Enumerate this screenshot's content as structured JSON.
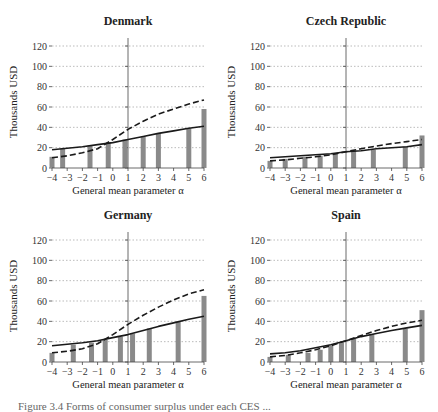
{
  "figure": {
    "ylabel": "Thousands USD",
    "xlabel": "General mean parameter α",
    "caption": "Figure 3.4   Forms of consumer surplus under each CES ..."
  },
  "chart_data": [
    {
      "type": "bar+line",
      "title": "Denmark",
      "xlabel": "General mean parameter α",
      "ylabel": "Thousands USD",
      "xlim": [
        -4,
        6
      ],
      "ylim": [
        0,
        120
      ],
      "xticks": [
        -4,
        -3,
        -2,
        -1,
        0,
        1,
        2,
        3,
        4,
        5,
        6
      ],
      "yticks": [
        0,
        20,
        40,
        60,
        80,
        100,
        120
      ],
      "grid": "horizontal dotted",
      "vline_at": 1,
      "bars": {
        "x": [
          -4,
          -3.3,
          -1.5,
          -0.3,
          0.8,
          2,
          3,
          5,
          6
        ],
        "values": [
          11,
          19,
          22,
          25,
          28,
          31,
          34,
          39,
          58
        ]
      },
      "series": [
        {
          "name": "solid",
          "style": "solid",
          "x": [
            -4,
            -3,
            -2,
            -1,
            0,
            1,
            2,
            3,
            4,
            5,
            6
          ],
          "values": [
            18,
            19.5,
            21,
            23,
            25,
            28,
            31,
            34,
            36.5,
            39,
            41
          ]
        },
        {
          "name": "dashed",
          "style": "dashed",
          "x": [
            -4,
            -3,
            -2,
            -1,
            0,
            1,
            2,
            3,
            4,
            5,
            6
          ],
          "values": [
            10,
            12,
            15,
            19,
            28,
            38,
            46,
            53,
            58,
            63,
            67
          ]
        }
      ]
    },
    {
      "type": "bar+line",
      "title": "Czech Republic",
      "xlabel": "General mean parameter α",
      "ylabel": "Thousands USD",
      "xlim": [
        -4,
        6
      ],
      "ylim": [
        0,
        120
      ],
      "xticks": [
        -4,
        -3,
        -2,
        -1,
        0,
        1,
        2,
        3,
        4,
        5,
        6
      ],
      "yticks": [
        0,
        20,
        40,
        60,
        80,
        100,
        120
      ],
      "grid": "horizontal dotted",
      "vline_at": 1,
      "bars": {
        "x": [
          -4,
          -3,
          -1.7,
          -0.7,
          0.3,
          1.5,
          2.8,
          4.9,
          6
        ],
        "values": [
          7,
          9,
          11,
          12,
          14,
          17,
          18,
          21,
          32
        ]
      },
      "series": [
        {
          "name": "solid",
          "style": "solid",
          "x": [
            -4,
            -3,
            -2,
            -1,
            0,
            1,
            2,
            3,
            4,
            5,
            6
          ],
          "values": [
            10,
            11,
            12,
            13,
            14,
            16,
            17,
            19,
            20,
            21,
            23
          ]
        },
        {
          "name": "dashed",
          "style": "dashed",
          "x": [
            -4,
            -3,
            -2,
            -1,
            0,
            1,
            2,
            3,
            4,
            5,
            6
          ],
          "values": [
            7,
            8,
            9.5,
            11,
            13,
            16,
            19,
            21.5,
            24,
            26,
            28
          ]
        }
      ]
    },
    {
      "type": "bar+line",
      "title": "Germany",
      "xlabel": "General mean parameter α",
      "ylabel": "Thousands USD",
      "xlim": [
        -4,
        6
      ],
      "ylim": [
        0,
        120
      ],
      "xticks": [
        -4,
        -3,
        -2,
        -1,
        0,
        1,
        2,
        3,
        4,
        5,
        6
      ],
      "yticks": [
        0,
        20,
        40,
        60,
        80,
        100,
        120
      ],
      "grid": "horizontal dotted",
      "vline_at": 1,
      "bars": {
        "x": [
          -4,
          -2.6,
          -1.4,
          -0.5,
          0.5,
          1.3,
          2.4,
          4.3,
          6
        ],
        "values": [
          9,
          17,
          19,
          22,
          25,
          28,
          33,
          40,
          65
        ]
      },
      "series": [
        {
          "name": "solid",
          "style": "solid",
          "x": [
            -4,
            -3,
            -2,
            -1,
            0,
            1,
            2,
            3,
            4,
            5,
            6
          ],
          "values": [
            16,
            17.5,
            19,
            21,
            24,
            27,
            31,
            35,
            38.5,
            42,
            45
          ]
        },
        {
          "name": "dashed",
          "style": "dashed",
          "x": [
            -4,
            -3,
            -2,
            -1,
            0,
            1,
            2,
            3,
            4,
            5,
            6
          ],
          "values": [
            9,
            10.5,
            13,
            18,
            27,
            37,
            46,
            54,
            61,
            67,
            71
          ]
        }
      ]
    },
    {
      "type": "bar+line",
      "title": "Spain",
      "xlabel": "General mean parameter α",
      "ylabel": "Thousands USD",
      "xlim": [
        -4,
        6
      ],
      "ylim": [
        0,
        120
      ],
      "xticks": [
        -4,
        -3,
        -2,
        -1,
        0,
        1,
        2,
        3,
        4,
        5,
        6
      ],
      "yticks": [
        0,
        20,
        40,
        60,
        80,
        100,
        120
      ],
      "grid": "horizontal dotted",
      "vline_at": 1,
      "bars": {
        "x": [
          -4,
          -2.8,
          -1.5,
          -0.7,
          0,
          0.7,
          1.5,
          2.7,
          4.9,
          6
        ],
        "values": [
          5,
          7,
          9,
          12,
          16,
          19,
          23,
          27,
          33,
          51
        ]
      },
      "series": [
        {
          "name": "solid",
          "style": "solid",
          "x": [
            -4,
            -3,
            -2,
            -1,
            0,
            1,
            2,
            3,
            4,
            5,
            6
          ],
          "values": [
            8,
            9,
            11,
            14,
            17,
            21,
            25,
            28,
            31,
            33.5,
            36
          ]
        },
        {
          "name": "dashed",
          "style": "dashed",
          "x": [
            -4,
            -3,
            -2,
            -1,
            0,
            1,
            2,
            3,
            4,
            5,
            6
          ],
          "values": [
            5,
            6.5,
            9,
            12,
            16,
            21,
            26,
            31,
            35,
            38.5,
            41
          ]
        }
      ]
    }
  ]
}
